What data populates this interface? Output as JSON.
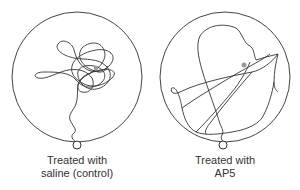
{
  "panels": [
    {
      "id": "saline",
      "caption_line1": "Treated with",
      "caption_line2": "saline (control)",
      "pool": "circle",
      "path_style": "tangled, concentrated near platform"
    },
    {
      "id": "ap5",
      "caption_line1": "Treated with",
      "caption_line2": "AP5",
      "pool": "circle",
      "path_style": "wide-ranging, long straight sweeps"
    }
  ],
  "colors": {
    "line": "#333333",
    "platform": "#999999",
    "background": "#ffffff"
  }
}
